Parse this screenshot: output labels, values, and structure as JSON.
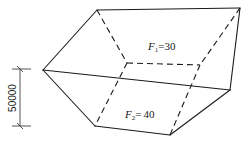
{
  "diagram": {
    "type": "prismatoid-earthwork-volume",
    "top_face_label": {
      "symbol": "F",
      "subscript": "1",
      "relation": "=",
      "value": "30"
    },
    "bottom_face_label": {
      "symbol": "F",
      "subscript": "2",
      "relation": "=",
      "value": "40"
    },
    "height_dimension": "50000",
    "colors": {
      "line": "#1a1a1a",
      "background": "#ffffff"
    }
  }
}
